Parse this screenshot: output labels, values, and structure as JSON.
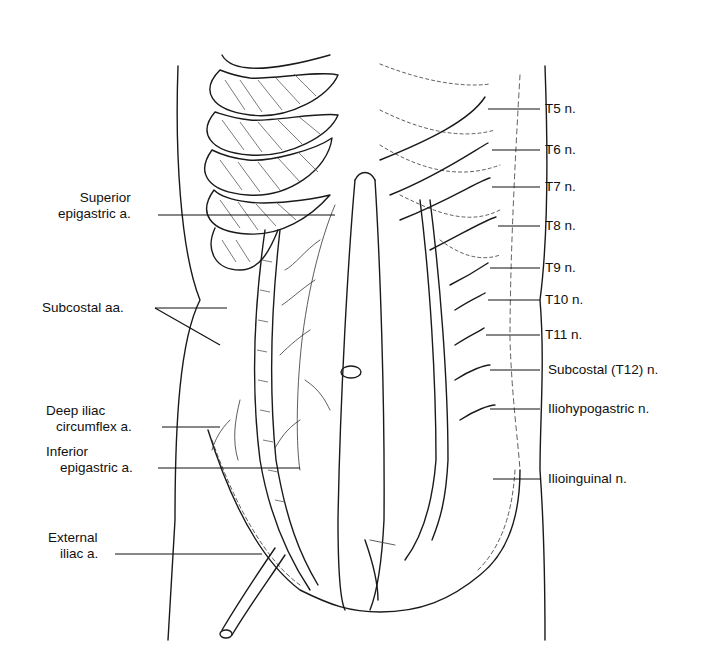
{
  "figure": {
    "ink_color": "#1a1a1a",
    "background": "#ffffff"
  },
  "labels": {
    "left": [
      {
        "id": "superior-epigastric",
        "lines": [
          "Superior",
          "epigastric a."
        ]
      },
      {
        "id": "subcostal-arteries",
        "lines": [
          "Subcostal aa."
        ]
      },
      {
        "id": "deep-iliac-circumflex",
        "lines": [
          "Deep iliac",
          "circumflex a."
        ]
      },
      {
        "id": "inferior-epigastric",
        "lines": [
          "Inferior",
          "epigastric a."
        ]
      },
      {
        "id": "external-iliac",
        "lines": [
          "External",
          "iliac a."
        ]
      }
    ],
    "right": [
      {
        "id": "t5",
        "text": "T5 n."
      },
      {
        "id": "t6",
        "text": "T6 n."
      },
      {
        "id": "t7",
        "text": "T7 n."
      },
      {
        "id": "t8",
        "text": "T8 n."
      },
      {
        "id": "t9",
        "text": "T9 n."
      },
      {
        "id": "t10",
        "text": "T10 n."
      },
      {
        "id": "t11",
        "text": "T11 n."
      },
      {
        "id": "subcostal-t12",
        "text": "Subcostal (T12) n."
      },
      {
        "id": "iliohypogastric",
        "text": "Iliohypogastric n."
      },
      {
        "id": "ilioinguinal",
        "text": "Ilioinguinal n."
      }
    ]
  }
}
